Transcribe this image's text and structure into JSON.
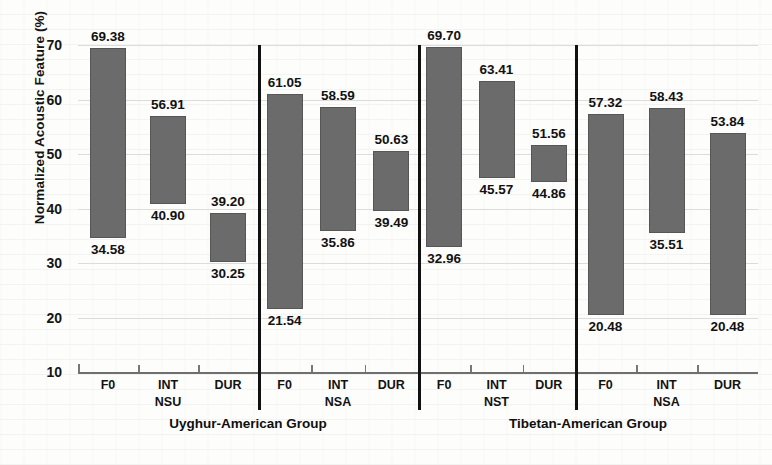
{
  "chart_data": {
    "type": "bar",
    "bar_style": "floating-range",
    "title": "",
    "xlabel": "",
    "ylabel": "Normalized Acoustic Feature (%)",
    "ylim": [
      10,
      70
    ],
    "yticks": [
      70,
      60,
      50,
      40,
      30,
      20,
      10
    ],
    "grid": true,
    "legend": "none",
    "bar_color": "#6b6b6b",
    "categories": [
      "F0",
      "INT",
      "DUR"
    ],
    "groups": [
      {
        "group_label": "NSU",
        "super_label": "Uyghur-American Group",
        "bars": [
          {
            "category": "F0",
            "low": 34.58,
            "high": 69.38
          },
          {
            "category": "INT",
            "low": 40.9,
            "high": 56.91
          },
          {
            "category": "DUR",
            "low": 30.25,
            "high": 39.2
          }
        ]
      },
      {
        "group_label": "NSA",
        "super_label": "Uyghur-American Group",
        "bars": [
          {
            "category": "F0",
            "low": 21.54,
            "high": 61.05
          },
          {
            "category": "INT",
            "low": 35.86,
            "high": 58.59
          },
          {
            "category": "DUR",
            "low": 39.49,
            "high": 50.63
          }
        ]
      },
      {
        "group_label": "NST",
        "super_label": "Tibetan-American Group",
        "bars": [
          {
            "category": "F0",
            "low": 32.96,
            "high": 69.7
          },
          {
            "category": "INT",
            "low": 45.57,
            "high": 63.41
          },
          {
            "category": "DUR",
            "low": 44.86,
            "high": 51.56
          }
        ]
      },
      {
        "group_label": "NSA",
        "super_label": "Tibetan-American Group",
        "bars": [
          {
            "category": "F0",
            "low": 20.48,
            "high": 57.32
          },
          {
            "category": "INT",
            "low": 35.51,
            "high": 58.43
          },
          {
            "category": "DUR",
            "low": 20.48,
            "high": 53.84
          }
        ]
      }
    ],
    "super_labels": [
      "Uyghur-American Group",
      "Tibetan-American Group"
    ]
  }
}
